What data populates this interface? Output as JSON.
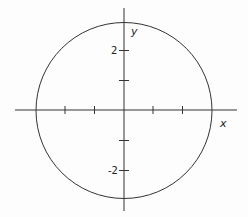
{
  "figure": {
    "type": "circle-graph",
    "equation_implied": "x^2 + y^2 = 9",
    "axes": {
      "x_label": "x",
      "y_label": "y",
      "y_tick_labels": [
        "2",
        "-2"
      ],
      "x_ticks": [
        -2,
        -1,
        1,
        2
      ],
      "y_ticks": [
        2,
        1,
        -1,
        -2
      ]
    },
    "circle": {
      "center": [
        0,
        0
      ],
      "radius": 3
    },
    "colors": {
      "stroke": "#333333",
      "background": "#fdfdfd"
    }
  }
}
